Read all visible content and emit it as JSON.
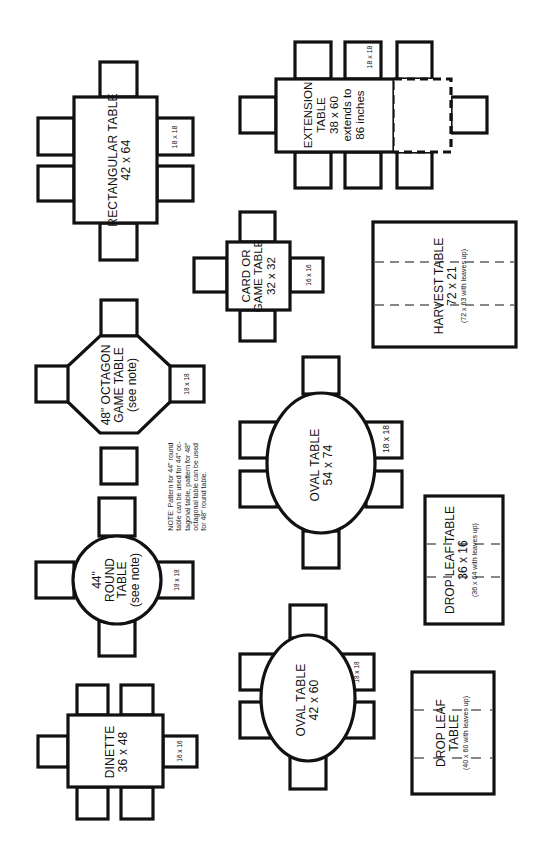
{
  "colors": {
    "line": "#111111",
    "background": "#ffffff"
  },
  "tables": {
    "rectangular": {
      "name": "RECTANGULAR TABLE",
      "size": "42 x 64",
      "chair_size": "18 x 18",
      "chairs": 6
    },
    "extension": {
      "name_line1": "EXTENSION",
      "name_line2": "TABLE",
      "size": "38 x 60",
      "extends_line1": "extends to",
      "extends_line2": "86 inches",
      "chair_size": "18 x 18",
      "chairs": 8
    },
    "card": {
      "name_line1": "CARD OR",
      "name_line2": "GAME TABLE",
      "size": "32 x 32",
      "chair_size": "16 x 16",
      "chairs": 4
    },
    "harvest": {
      "name": "HARVEST TABLE",
      "size": "72 x 21",
      "leaves_note": "(72 x 63 with leaves up)"
    },
    "octagon": {
      "name_line1": "48\" OCTAGON",
      "name_line2": "GAME TABLE",
      "see_note": "(see note)",
      "chair_size": "18 x 18",
      "chairs": 4
    },
    "oval_large": {
      "name": "OVAL TABLE",
      "size": "54 x 74",
      "chair_size": "18 x 18",
      "chairs": 6
    },
    "round": {
      "name_line1": "44\"",
      "name_line2": "ROUND",
      "name_line3": "TABLE",
      "see_note": "(see note)",
      "chair_size": "18 x 18",
      "chairs": 4
    },
    "drop_leaf_small": {
      "name": "DROP LEAF TABLE",
      "size": "36 x 16",
      "leaves_note": "(36 x 64 with leaves up)"
    },
    "dinette": {
      "name": "DINETTE",
      "size": "36 x 48",
      "chair_size": "16 x 16",
      "chairs": 6
    },
    "oval_small": {
      "name": "OVAL TABLE",
      "size": "42 x 60",
      "chair_size": "18 x 18",
      "chairs": 6
    },
    "drop_leaf_large": {
      "name_line1": "DROP LEAF",
      "name_line2": "TABLE",
      "leaves_note": "(40 x 60 with leaves up)"
    }
  },
  "note": {
    "line1": "NOTE: Pattern for 44\" round",
    "line2": "table can be used for 44\" oc-",
    "line3": "tagonal table, pattern for 48\"",
    "line4": "octagonal table can be used",
    "line5": "for 48\" round table."
  }
}
